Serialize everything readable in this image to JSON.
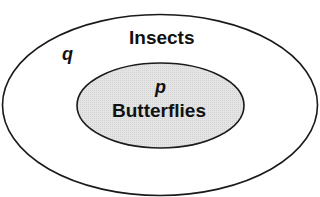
{
  "diagram": {
    "type": "euler_diagram",
    "colors": {
      "background": "#ffffff",
      "stroke": "#1a1a1a",
      "inner_fill": "#e2e2e2",
      "text": "#111111"
    },
    "outer_set": {
      "label": "Insects",
      "variable": "q"
    },
    "inner_set": {
      "label": "Butterflies",
      "variable": "p"
    },
    "relation": "Butterflies is a subset of Insects"
  }
}
